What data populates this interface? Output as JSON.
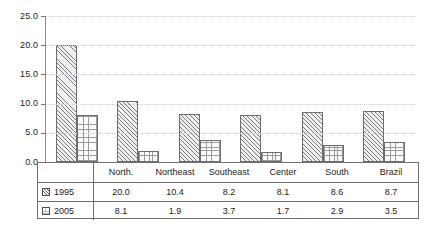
{
  "chart_data": {
    "type": "bar",
    "title": "",
    "xlabel": "",
    "ylabel": "",
    "ylim": [
      0.0,
      25.0
    ],
    "ytick_labels": [
      "0.0",
      "5.0",
      "10.0",
      "15.0",
      "20.0",
      "25.0"
    ],
    "ytick_values": [
      0.0,
      5.0,
      10.0,
      15.0,
      20.0,
      25.0
    ],
    "grid": "horizontal-dotted",
    "legend_position": "table-left-column",
    "categories": [
      "North.",
      "Northeast",
      "Southeast",
      "Center",
      "South",
      "Brazil"
    ],
    "series": [
      {
        "name": "1995",
        "pattern": "diagonal-hatch",
        "values": [
          20.0,
          10.4,
          8.2,
          8.1,
          8.6,
          8.7
        ]
      },
      {
        "name": "2005",
        "pattern": "fine-grid",
        "values": [
          8.1,
          1.9,
          3.7,
          1.7,
          2.9,
          3.5
        ]
      }
    ],
    "value_labels": {
      "1995": [
        "20.0",
        "10.4",
        "8.2",
        "8.1",
        "8.6",
        "8.7"
      ],
      "2005": [
        "8.1",
        "1.9",
        "3.7",
        "1.7",
        "2.9",
        "3.5"
      ]
    }
  },
  "table": {
    "header_row": [
      "North.",
      "Northeast",
      "Southeast",
      "Center",
      "South",
      "Brazil"
    ],
    "rows": [
      {
        "legend": "1995",
        "swatch": "diagonal-hatch-swatch",
        "values": [
          "20.0",
          "10.4",
          "8.2",
          "8.1",
          "8.6",
          "8.7"
        ]
      },
      {
        "legend": "2005",
        "swatch": "fine-grid-swatch",
        "values": [
          "8.1",
          "1.9",
          "3.7",
          "1.7",
          "2.9",
          "3.5"
        ]
      }
    ]
  },
  "colors": {
    "axis": "#8a8a8a",
    "gridline": "#c9c9d6",
    "bar_outline": "#6d6d6d",
    "table_border": "#6f6f6f",
    "text": "#1b1b1b",
    "background": "#ffffff"
  }
}
